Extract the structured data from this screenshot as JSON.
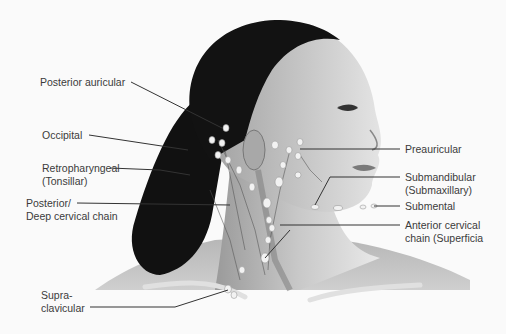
{
  "diagram": {
    "colors": {
      "background": "#fafafa",
      "skin_light": "#e6e6e6",
      "skin_mid": "#bdbdbd",
      "skin_dark": "#8a8a8a",
      "hair": "#0e0e0e",
      "node": "#f2f2f2",
      "leader_line": "#333333",
      "label_text": "#3a3a3a"
    },
    "labels_left": [
      {
        "id": "posterior-auricular",
        "lines": [
          "Posterior auricular"
        ]
      },
      {
        "id": "occipital",
        "lines": [
          "Occipital"
        ]
      },
      {
        "id": "retropharyngeal",
        "lines": [
          "Retropharyngeal",
          "(Tonsillar)"
        ]
      },
      {
        "id": "posterior-deep-cervical",
        "lines": [
          "Posterior/",
          "Deep cervical chain"
        ]
      },
      {
        "id": "supraclavicular",
        "lines": [
          "Supra-",
          "clavicular"
        ]
      }
    ],
    "labels_right": [
      {
        "id": "preauricular",
        "lines": [
          "Preauricular"
        ]
      },
      {
        "id": "submandibular",
        "lines": [
          "Submandibular",
          "(Submaxillary)"
        ]
      },
      {
        "id": "submental",
        "lines": [
          "Submental"
        ]
      },
      {
        "id": "anterior-cervical",
        "lines": [
          "Anterior cervical",
          "chain (Superficia"
        ]
      }
    ]
  }
}
